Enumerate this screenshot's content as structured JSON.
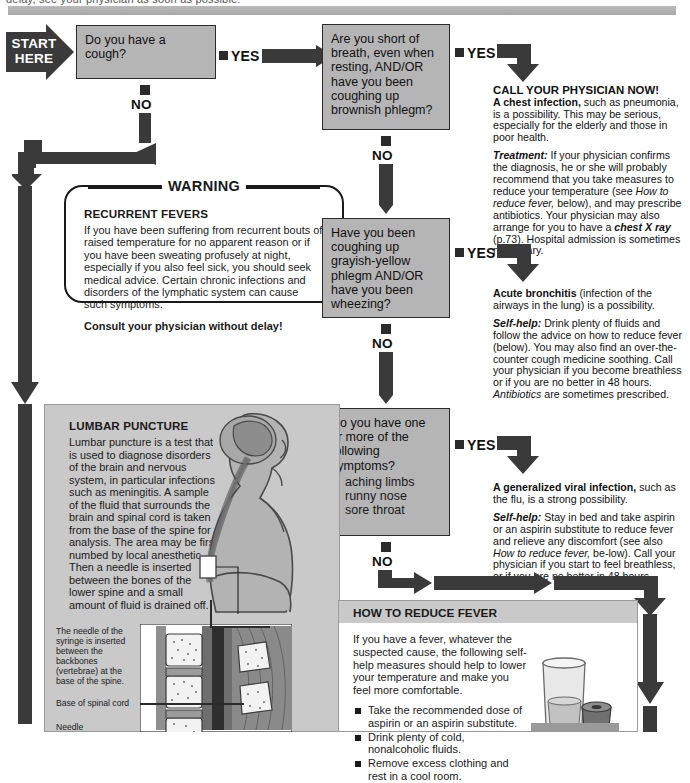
{
  "header": {
    "clipped_line": "delay, see your physician as soon as possible."
  },
  "start": {
    "line1": "START",
    "line2": "HERE"
  },
  "questions": [
    {
      "id": "q-cough",
      "text": "Do you have a\ncough?",
      "yes": "YES",
      "no": "NO"
    },
    {
      "id": "q-short-of-breath",
      "text": "Are you short of\nbreath, even when\nresting, AND/OR\nhave you been\ncoughing up\nbrownish phlegm?",
      "yes": "YES",
      "no": "NO"
    },
    {
      "id": "q-grayish-phlegm",
      "text": "Have you been\ncoughing up\ngrayish-yellow\nphlegm AND/OR\nhave you been\nwheezing?",
      "yes": "YES",
      "no": "NO"
    },
    {
      "id": "q-symptoms",
      "text": "Do you have one\nor more of the\nfollowing\nsymptoms?",
      "bullets": [
        "aching limbs",
        "runny nose",
        "sore throat"
      ],
      "yes": "YES",
      "no": "NO"
    }
  ],
  "answers": {
    "chest_infection": {
      "heading": "CALL YOUR PHYSICIAN NOW!",
      "lead_bold": "A chest infection,",
      "lead_rest": " such as pneumonia, is a possibility. This may be serious, especially for the elderly and those in poor health.",
      "treatment_label": "Treatment:",
      "treatment_p1": " If your physician confirms the diagnosis, he or she will probably recommend that you take measures to reduce your temperature (see ",
      "treatment_italic1": "How to reduce fever,",
      "treatment_p2": " below), and may prescribe antibiotics. Your physician may also arrange for you to have a ",
      "treatment_italic2": "chest X ray",
      "treatment_p3": " (p.73). Hospital admission is sometimes necessary."
    },
    "bronchitis": {
      "lead_bold": "Acute bronchitis",
      "lead_rest": " (infection of the airways in the lung) is a possibility.",
      "selfhelp_label": "Self-help:",
      "selfhelp_p1": " Drink plenty of fluids and follow the advice on how to reduce fever (below). You may also find an over-the-counter cough medicine soothing. Call your physician if you become breathless or if you are no better in 48 hours. ",
      "selfhelp_italic": "Antibiotics",
      "selfhelp_p2": " are sometimes prescribed."
    },
    "viral": {
      "lead_bold": "A generalized viral infection,",
      "lead_rest": " such as the flu, is a strong possibility.",
      "selfhelp_label": "Self-help:",
      "selfhelp_p1": " Stay in bed and take aspirin or an aspirin substitute to reduce fever and relieve any discomfort (see also ",
      "selfhelp_italic": "How to reduce fever,",
      "selfhelp_p2": " be-low). Call your physician if you start to feel breathless, or if you are no better in 48 hours."
    }
  },
  "warning": {
    "title": "WARNING",
    "heading": "RECURRENT FEVERS",
    "body": "If you have been suffering from recurrent bouts of raised temperature for no apparent reason or if you have been sweating profusely at night, especially if you also feel sick, you should seek medical advice. Certain chronic infections and disorders of the lymphatic system can cause such symptoms.",
    "footer": "Consult your physician without delay!"
  },
  "lumbar": {
    "heading": "LUMBAR PUNCTURE",
    "body": "Lumbar puncture is a test that is used to diagnose disorders of the brain and nervous system, in particular infections such as meningitis. A sample of the fluid that surrounds the brain and spinal cord is taken from the base of the spine for analysis. The area may be first numbed by local anesthetic. Then a needle is inserted between the bones of the lower spine and a small amount of fluid is drained off.",
    "caption_needle": "The needle of the syringe is inserted between the backbones (vertebrae) at the base of the spine.",
    "caption_cord": "Base of spinal cord",
    "caption_needle_label": "Needle"
  },
  "fever_box": {
    "heading": "HOW TO REDUCE FEVER",
    "intro": "If you have a fever, whatever the suspected cause, the following self-help measures should help to lower your temperature and make you feel more comfortable.",
    "bullets": [
      "Take the recommended dose of aspirin or an aspirin substitute.",
      "Drink plenty of cold, nonalcoholic fluids.",
      "Remove excess clothing and rest in a cool room."
    ]
  },
  "colors": {
    "box_fill": "#b5b5b5",
    "arrow_dark": "#3a3a3a",
    "panel_fill": "#c9c9c9",
    "ink": "#1a1a1a"
  }
}
